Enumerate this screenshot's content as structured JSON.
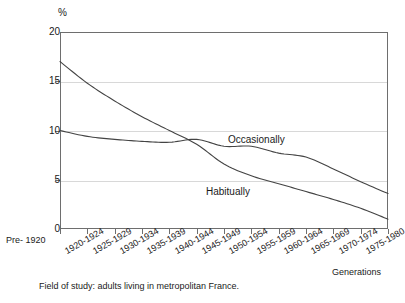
{
  "figure": {
    "y_unit_label": "%",
    "x_axis_title": "Generations",
    "caption": "Field of study: adults living in metropolitan France."
  },
  "chart_data": {
    "type": "line",
    "title": "",
    "subtitle": "",
    "xlabel": "Generations",
    "ylabel": "%",
    "ylim": [
      0,
      20
    ],
    "yticks": [
      0,
      5,
      10,
      15,
      20
    ],
    "ytick_labels": [
      "0",
      "5",
      "10",
      "15",
      "20"
    ],
    "grid": "horizontal",
    "legend_position": "inline",
    "categories": [
      "Pre- 1920",
      "1920-1924",
      "1925-1929",
      "1930-1934",
      "1935-1939",
      "1940-1944",
      "1945-1949",
      "1950-1954",
      "1955-1959",
      "1960-1964",
      "1965-1969",
      "1970-1974",
      "1975-1980"
    ],
    "series": [
      {
        "name": "Habitually",
        "values": [
          17.0,
          14.8,
          13.0,
          11.4,
          10.0,
          8.6,
          6.6,
          5.4,
          4.6,
          3.8,
          3.0,
          2.1,
          1.0
        ]
      },
      {
        "name": "Occasionally",
        "values": [
          10.0,
          9.4,
          9.1,
          8.9,
          8.8,
          9.1,
          8.4,
          8.4,
          7.7,
          7.3,
          6.1,
          4.8,
          3.6
        ]
      }
    ],
    "annotations": [
      {
        "text": "Occasionally",
        "series": "Occasionally"
      },
      {
        "text": "Habitually",
        "series": "Habitually"
      }
    ],
    "colors": {
      "line": "#444444",
      "axis": "#6e6e6e",
      "grid": "#d8d8d8",
      "background": "#ffffff"
    }
  }
}
